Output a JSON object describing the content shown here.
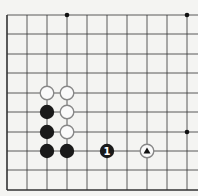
{
  "board": {
    "background": "#f4f4f2",
    "line_color": "#333333",
    "x_lines": [
      7,
      27,
      47,
      67,
      87,
      107,
      127,
      147,
      167,
      187
    ],
    "y_lines": [
      15,
      34,
      54,
      73,
      93,
      112,
      132,
      151,
      170,
      190
    ],
    "hoshi": [
      [
        67,
        15
      ],
      [
        187,
        15
      ],
      [
        187,
        132
      ]
    ],
    "stones": [
      {
        "x": 47,
        "y": 93,
        "color": "white",
        "label": ""
      },
      {
        "x": 67,
        "y": 93,
        "color": "white",
        "label": ""
      },
      {
        "x": 67,
        "y": 112,
        "color": "white",
        "label": ""
      },
      {
        "x": 67,
        "y": 132,
        "color": "white",
        "label": ""
      },
      {
        "x": 47,
        "y": 112,
        "color": "black",
        "label": ""
      },
      {
        "x": 47,
        "y": 132,
        "color": "black",
        "label": ""
      },
      {
        "x": 47,
        "y": 151,
        "color": "black",
        "label": ""
      },
      {
        "x": 67,
        "y": 151,
        "color": "black",
        "label": ""
      },
      {
        "x": 107,
        "y": 151,
        "color": "black",
        "label": "1"
      },
      {
        "x": 147,
        "y": 151,
        "color": "white",
        "label": "triangle"
      }
    ]
  }
}
